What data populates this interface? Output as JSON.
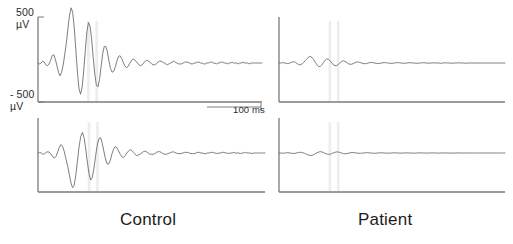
{
  "figure": {
    "kind": "erp-waveform-figure",
    "background": "#ffffff",
    "trace_color": "#6f6f6f",
    "axis_color": "#7a7a7a",
    "marker_color": "#ededed",
    "width": 513,
    "height": 244
  },
  "axis": {
    "y_top_label": "500\nµV",
    "y_top_value": "500",
    "y_top_unit": "µV",
    "y_bottom_label": "- 500\nµV",
    "y_bottom_value": "- 500",
    "y_bottom_unit": "µV",
    "time_scale_label": "100 ms",
    "time_scale_value": 100,
    "time_scale_unit": "ms",
    "ylim": [
      -500,
      500
    ],
    "grid": false
  },
  "groups": [
    {
      "id": "control",
      "label": "Control"
    },
    {
      "id": "patient",
      "label": "Patient"
    }
  ],
  "markers": {
    "description": "paired vertical stimulus markers",
    "x_fraction": [
      0.225,
      0.262
    ]
  },
  "chart_data": {
    "type": "line",
    "title": "",
    "subtitle": "",
    "xlabel": "",
    "ylabel": "µV",
    "xlim": [
      0,
      500
    ],
    "ylim": [
      -500,
      500
    ],
    "grid": false,
    "legend": "none",
    "annotations": [
      "500 µV",
      "- 500 µV",
      "100 ms",
      "Control",
      "Patient"
    ],
    "panels": [
      {
        "id": "control-top",
        "group": "Control",
        "row": 1,
        "amplitude_scale": 1.0,
        "y": [
          0,
          -1,
          0,
          2,
          1,
          -2,
          -3,
          -1,
          3,
          8,
          9,
          4,
          -3,
          -10,
          -14,
          -10,
          -2,
          10,
          22,
          38,
          52,
          60,
          55,
          38,
          14,
          -10,
          -28,
          -34,
          -26,
          -8,
          14,
          34,
          44,
          40,
          26,
          6,
          -12,
          -24,
          -26,
          -18,
          -4,
          10,
          18,
          18,
          12,
          2,
          -6,
          -10,
          -9,
          -4,
          2,
          7,
          8,
          5,
          1,
          -3,
          -5,
          -4,
          -1,
          2,
          4,
          4,
          2,
          0,
          -2,
          -3,
          -2,
          0,
          2,
          3,
          2,
          1,
          -1,
          -2,
          -2,
          -1,
          1,
          2,
          2,
          1,
          0,
          -1,
          -2,
          -1,
          0,
          1,
          2,
          1,
          0,
          -1,
          -1,
          -1,
          0,
          1,
          1,
          1,
          0,
          -1,
          -1,
          0,
          0,
          1,
          1,
          0,
          0,
          -1,
          -1,
          0,
          0,
          1,
          1,
          0,
          0,
          -1,
          0,
          0,
          1,
          1,
          0,
          0,
          -1,
          0,
          0,
          1,
          0,
          0,
          0,
          -1,
          0,
          0,
          1,
          0,
          0,
          0,
          -1,
          0,
          0,
          0,
          0,
          0,
          0,
          0,
          0
        ]
      },
      {
        "id": "control-bottom",
        "group": "Control",
        "row": 2,
        "amplitude_scale": 0.92,
        "y": [
          0,
          1,
          0,
          -2,
          -1,
          1,
          2,
          1,
          -2,
          -6,
          -8,
          -5,
          2,
          9,
          13,
          10,
          2,
          -9,
          -20,
          -33,
          -46,
          -54,
          -50,
          -34,
          -12,
          10,
          26,
          32,
          24,
          7,
          -14,
          -32,
          -42,
          -38,
          -24,
          -5,
          12,
          22,
          24,
          16,
          3,
          -9,
          -17,
          -17,
          -11,
          -1,
          6,
          10,
          8,
          3,
          -2,
          -6,
          -7,
          -4,
          0,
          3,
          5,
          4,
          1,
          -2,
          -4,
          -3,
          -2,
          0,
          2,
          3,
          2,
          0,
          -2,
          -2,
          -2,
          -1,
          1,
          2,
          2,
          1,
          -1,
          -2,
          -2,
          -1,
          0,
          1,
          2,
          1,
          0,
          -1,
          -1,
          -1,
          0,
          1,
          1,
          1,
          0,
          -1,
          -1,
          -1,
          0,
          1,
          1,
          0,
          0,
          -1,
          -1,
          0,
          0,
          1,
          1,
          0,
          0,
          -1,
          0,
          0,
          1,
          1,
          0,
          0,
          -1,
          0,
          0,
          1,
          0,
          0,
          0,
          -1,
          0,
          0,
          1,
          0,
          0,
          0,
          -1,
          0,
          0,
          0,
          0,
          0,
          0,
          0,
          0
        ]
      },
      {
        "id": "patient-top",
        "group": "Patient",
        "row": 1,
        "amplitude_scale": 0.34,
        "y": [
          0,
          0,
          1,
          1,
          -1,
          -2,
          -1,
          1,
          3,
          4,
          2,
          -2,
          -5,
          -6,
          -3,
          2,
          8,
          14,
          19,
          21,
          18,
          11,
          2,
          -6,
          -11,
          -11,
          -6,
          2,
          9,
          13,
          12,
          7,
          0,
          -6,
          -9,
          -8,
          -4,
          1,
          5,
          7,
          5,
          2,
          -2,
          -4,
          -4,
          -2,
          1,
          3,
          3,
          2,
          0,
          -2,
          -2,
          -2,
          0,
          1,
          2,
          1,
          0,
          -1,
          -2,
          -1,
          0,
          1,
          1,
          1,
          0,
          -1,
          -1,
          -1,
          0,
          1,
          1,
          1,
          0,
          -1,
          -1,
          0,
          0,
          1,
          1,
          0,
          0,
          -1,
          -1,
          0,
          0,
          1,
          1,
          0,
          0,
          -1,
          0,
          0,
          1,
          0,
          0,
          0,
          -1,
          0,
          0,
          1,
          0,
          0,
          0,
          -1,
          0,
          0,
          0,
          1,
          0,
          0,
          0,
          -1,
          0,
          0,
          0,
          0,
          0,
          0,
          0,
          0,
          0,
          0,
          0,
          0,
          0,
          0,
          0,
          0,
          0,
          0,
          0,
          0,
          0,
          0,
          0,
          0
        ]
      },
      {
        "id": "patient-bottom",
        "group": "Patient",
        "row": 2,
        "amplitude_scale": 0.22,
        "y": [
          0,
          0,
          -1,
          -1,
          1,
          2,
          1,
          -1,
          -3,
          -3,
          -1,
          2,
          4,
          5,
          2,
          -2,
          -7,
          -12,
          -15,
          -16,
          -13,
          -7,
          0,
          5,
          8,
          8,
          4,
          -2,
          -6,
          -9,
          -8,
          -4,
          1,
          5,
          7,
          6,
          3,
          -1,
          -4,
          -5,
          -4,
          -1,
          2,
          3,
          3,
          1,
          -1,
          -2,
          -2,
          -1,
          0,
          2,
          2,
          1,
          0,
          -1,
          -2,
          -1,
          0,
          1,
          1,
          1,
          0,
          -1,
          -1,
          -1,
          0,
          1,
          1,
          1,
          0,
          -1,
          -1,
          0,
          0,
          1,
          1,
          0,
          0,
          -1,
          -1,
          0,
          0,
          1,
          1,
          0,
          0,
          -1,
          0,
          0,
          1,
          0,
          0,
          0,
          -1,
          0,
          0,
          1,
          0,
          0,
          0,
          -1,
          0,
          0,
          0,
          1,
          0,
          0,
          0,
          0,
          0,
          0,
          0,
          0,
          0,
          0,
          0,
          0,
          0,
          0,
          0,
          0,
          0,
          0,
          0,
          0,
          0,
          0,
          0,
          0,
          0,
          0,
          0,
          0
        ]
      }
    ]
  }
}
